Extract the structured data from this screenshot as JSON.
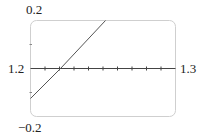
{
  "chart_data": {
    "type": "line",
    "title": "",
    "xlabel": "",
    "ylabel": "",
    "xlim": [
      1.2,
      1.3
    ],
    "ylim": [
      -0.2,
      0.2
    ],
    "x_tick_step": 0.01,
    "y_tick_step": 0.1,
    "grid": false,
    "labels": {
      "y_max": "0.2",
      "y_min": "−0.2",
      "x_min": "1.2",
      "x_max": "1.3"
    },
    "series": [
      {
        "name": "f(x)",
        "x": [
          1.2,
          1.2207,
          1.2517
        ],
        "y": [
          -0.125,
          0.0,
          0.2
        ]
      }
    ]
  }
}
